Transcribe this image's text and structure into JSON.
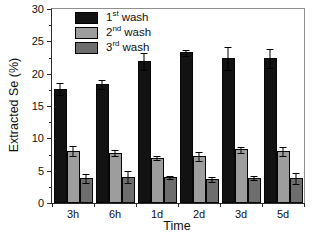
{
  "legend": [
    {
      "num": "1",
      "sup": "st",
      "rest": "wash"
    },
    {
      "num": "2",
      "sup": "nd",
      "rest": "wash"
    },
    {
      "num": "3",
      "sup": "rd",
      "rest": "wash"
    }
  ],
  "chart_data": {
    "type": "bar",
    "title": "",
    "xlabel": "Time",
    "ylabel": "Extracted Se (%)",
    "categories": [
      "3h",
      "6h",
      "1d",
      "2d",
      "3d",
      "5d"
    ],
    "series": [
      {
        "name": "1st wash",
        "color": "#121212",
        "values": [
          17.7,
          18.4,
          21.9,
          23.3,
          22.4,
          22.4
        ],
        "errors": [
          1.0,
          0.8,
          1.4,
          0.5,
          1.9,
          1.5
        ]
      },
      {
        "name": "2nd wash",
        "color": "#9d9d9d",
        "values": [
          8.1,
          7.8,
          7.0,
          7.3,
          8.3,
          8.0
        ],
        "errors": [
          0.9,
          0.5,
          0.4,
          0.8,
          0.5,
          0.8
        ]
      },
      {
        "name": "3rd wash",
        "color": "#6e6e6e",
        "values": [
          3.9,
          4.1,
          4.0,
          3.7,
          3.9,
          3.9
        ],
        "errors": [
          0.8,
          1.0,
          0.3,
          0.5,
          0.4,
          0.9
        ]
      }
    ],
    "ylim": [
      0,
      30
    ],
    "yticks": [
      0,
      5,
      10,
      15,
      20,
      25,
      30
    ],
    "ytick_step": 5,
    "yminor_step": 2.5,
    "grid": false,
    "legend_position": "top-left"
  }
}
